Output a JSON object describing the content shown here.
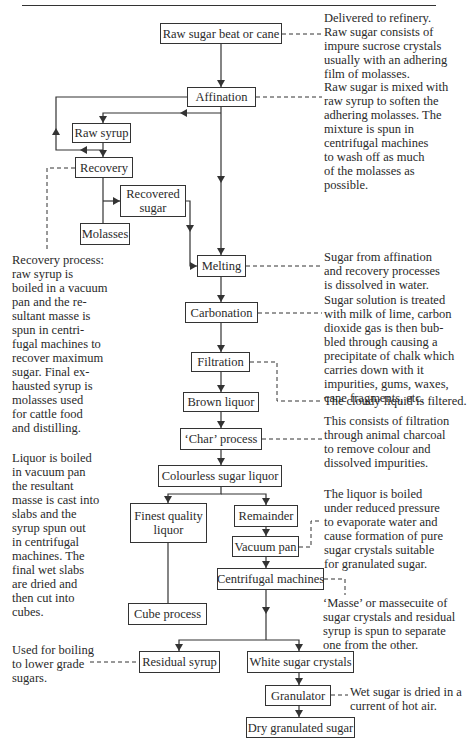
{
  "nodes": [
    {
      "id": "raw_sugar",
      "label": "Raw sugar beat or cane",
      "x": 160,
      "y": 23,
      "w": 122,
      "h": 21
    },
    {
      "id": "affination",
      "label": "Affination",
      "x": 187,
      "y": 87,
      "w": 69,
      "h": 20
    },
    {
      "id": "raw_syrup",
      "label": "Raw syrup",
      "x": 72,
      "y": 123,
      "w": 59,
      "h": 20
    },
    {
      "id": "recovery",
      "label": "Recovery",
      "x": 75,
      "y": 157,
      "w": 58,
      "h": 21
    },
    {
      "id": "recovered_sugar",
      "label": "Recovered\nsugar",
      "x": 120,
      "y": 185,
      "w": 66,
      "h": 32
    },
    {
      "id": "molasses",
      "label": "Molasses",
      "x": 80,
      "y": 223,
      "w": 50,
      "h": 22
    },
    {
      "id": "melting",
      "label": "Melting",
      "x": 197,
      "y": 255,
      "w": 49,
      "h": 22
    },
    {
      "id": "carbonation",
      "label": "Carbonation",
      "x": 185,
      "y": 302,
      "w": 73,
      "h": 21
    },
    {
      "id": "filtration",
      "label": "Filtration",
      "x": 191,
      "y": 352,
      "w": 59,
      "h": 20
    },
    {
      "id": "brown_liquor",
      "label": "Brown liquor",
      "x": 183,
      "y": 392,
      "w": 76,
      "h": 20
    },
    {
      "id": "char_process",
      "label": "‘Char’ process",
      "x": 180,
      "y": 428,
      "w": 82,
      "h": 22
    },
    {
      "id": "colourless_liquor",
      "label": "Colourless sugar liquor",
      "x": 158,
      "y": 465,
      "w": 124,
      "h": 22
    },
    {
      "id": "finest_liquor",
      "label": "Finest quality\nliquor",
      "x": 130,
      "y": 503,
      "w": 77,
      "h": 40
    },
    {
      "id": "remainder",
      "label": "Remainder",
      "x": 234,
      "y": 505,
      "w": 64,
      "h": 22
    },
    {
      "id": "vacuum_pan",
      "label": "Vacuum pan",
      "x": 232,
      "y": 536,
      "w": 67,
      "h": 21
    },
    {
      "id": "centrifugal",
      "label": "Centrifugal machines",
      "x": 217,
      "y": 568,
      "w": 107,
      "h": 22
    },
    {
      "id": "cube_process",
      "label": "Cube process",
      "x": 128,
      "y": 603,
      "w": 79,
      "h": 22
    },
    {
      "id": "residual_syrup",
      "label": "Residual syrup",
      "x": 139,
      "y": 651,
      "w": 81,
      "h": 22
    },
    {
      "id": "white_crystals",
      "label": "White sugar crystals",
      "x": 247,
      "y": 651,
      "w": 107,
      "h": 22
    },
    {
      "id": "granulator",
      "label": "Granulator",
      "x": 265,
      "y": 685,
      "w": 66,
      "h": 21
    },
    {
      "id": "dry_sugar",
      "label": "Dry granulated sugar",
      "x": 246,
      "y": 717,
      "w": 109,
      "h": 21
    }
  ],
  "notes": [
    {
      "id": "note_raw_sugar",
      "x": 324,
      "y": 11,
      "text": "Delivered to refinery.\nRaw sugar consists of\nimpure sucrose crystals\nusually with an adhering\nfilm of molasses."
    },
    {
      "id": "note_affination",
      "x": 324,
      "y": 80,
      "text": "Raw sugar is mixed with\nraw syrup to soften the\nadhering molasses. The\nmixture is spun in\ncentrifugal machines\nto wash off as much\nof the molasses as\npossible."
    },
    {
      "id": "note_recovery",
      "x": 12,
      "y": 253,
      "text": "Recovery process:\nraw syrup is\nboiled in a vacuum\npan and the re-\nsultant masse is\nspun in centri-\nfugal machines to\nrecover maximum\nsugar. Final ex-\nhausted syrup is\nmolasses used\nfor cattle food\nand distilling."
    },
    {
      "id": "note_melting",
      "x": 324,
      "y": 250,
      "text": "Sugar from affination\nand recovery processes\nis dissolved in water."
    },
    {
      "id": "note_carbonation",
      "x": 324,
      "y": 293,
      "text": "Sugar solution is treated\nwith milk of lime, carbon\ndioxide gas is then bub-\nbled through causing a\nprecipitate of chalk which\ncarries down with it\nimpurities, gums, waxes,\ncane fragments, etc."
    },
    {
      "id": "note_filtration",
      "x": 324,
      "y": 394,
      "text": "The cloudy liquid is filtered."
    },
    {
      "id": "note_char",
      "x": 324,
      "y": 414,
      "text": "This consists of filtration\nthrough animal charcoal\nto remove colour and\ndissolved impurities."
    },
    {
      "id": "note_cube",
      "x": 12,
      "y": 451,
      "text": "Liquor is boiled\nin vacuum pan\nthe resultant\nmasse is cast into\nslabs and the\nsyrup spun out\nin centrifugal\nmachines. The\nfinal wet slabs\nare dried and\nthen cut into\ncubes."
    },
    {
      "id": "note_vacuum_pan",
      "x": 324,
      "y": 487,
      "text": "The liquor is boiled\nunder reduced pressure\nto evaporate water and\ncause formation of pure\nsugar crystals suitable\nfor granulated sugar."
    },
    {
      "id": "note_centrifugal",
      "x": 323,
      "y": 596,
      "text": "‘Masse’ or massecuite of\nsugar crystals and residual\nsyrup is spun to separate\none from the other."
    },
    {
      "id": "note_residual",
      "x": 12,
      "y": 643,
      "text": "Used for boiling\nto lower grade\nsugars."
    },
    {
      "id": "note_granulator",
      "x": 350,
      "y": 685,
      "text": "Wet sugar is dried in a\ncurrent of hot air."
    }
  ],
  "arrows": [
    {
      "points": [
        [
          221,
          44
        ],
        [
          221,
          87
        ]
      ],
      "head": "down"
    },
    {
      "points": [
        [
          221,
          107
        ],
        [
          221,
          255
        ]
      ],
      "head": "down"
    },
    {
      "points": [
        [
          221,
          113
        ],
        [
          103,
          113
        ],
        [
          103,
          123
        ]
      ],
      "head": "down"
    },
    {
      "points": [
        [
          187,
          97
        ],
        [
          56,
          97
        ],
        [
          56,
          150
        ],
        [
          103,
          150
        ]
      ],
      "head": "none"
    },
    {
      "points": [
        [
          103,
          143
        ],
        [
          103,
          157
        ]
      ],
      "head": "down"
    },
    {
      "points": [
        [
          103,
          178
        ],
        [
          103,
          223
        ]
      ],
      "head": "none"
    },
    {
      "points": [
        [
          103,
          201
        ],
        [
          120,
          201
        ]
      ],
      "head": "right"
    },
    {
      "points": [
        [
          186,
          201
        ],
        [
          190,
          201
        ],
        [
          190,
          266
        ],
        [
          197,
          266
        ]
      ],
      "head": "right"
    },
    {
      "points": [
        [
          221,
          277
        ],
        [
          221,
          302
        ]
      ],
      "head": "down"
    },
    {
      "points": [
        [
          221,
          323
        ],
        [
          221,
          352
        ]
      ],
      "head": "down"
    },
    {
      "points": [
        [
          221,
          372
        ],
        [
          221,
          392
        ]
      ],
      "head": "down"
    },
    {
      "points": [
        [
          221,
          412
        ],
        [
          221,
          428
        ]
      ],
      "head": "down"
    },
    {
      "points": [
        [
          221,
          450
        ],
        [
          221,
          465
        ]
      ],
      "head": "down"
    },
    {
      "points": [
        [
          221,
          487
        ],
        [
          221,
          494
        ],
        [
          168,
          494
        ],
        [
          168,
          503
        ]
      ],
      "head": "down"
    },
    {
      "points": [
        [
          221,
          494
        ],
        [
          266,
          494
        ],
        [
          266,
          505
        ]
      ],
      "head": "down"
    },
    {
      "points": [
        [
          168,
          543
        ],
        [
          168,
          603
        ]
      ],
      "head": "none"
    },
    {
      "points": [
        [
          266,
          527
        ],
        [
          266,
          536
        ]
      ],
      "head": "down"
    },
    {
      "points": [
        [
          266,
          557
        ],
        [
          266,
          568
        ]
      ],
      "head": "down"
    },
    {
      "points": [
        [
          266,
          590
        ],
        [
          266,
          640
        ]
      ],
      "head": "none"
    },
    {
      "points": [
        [
          266,
          640
        ],
        [
          179,
          640
        ],
        [
          179,
          651
        ]
      ],
      "head": "down"
    },
    {
      "points": [
        [
          266,
          640
        ],
        [
          299,
          640
        ],
        [
          299,
          651
        ]
      ],
      "head": "down"
    },
    {
      "points": [
        [
          299,
          673
        ],
        [
          299,
          685
        ]
      ],
      "head": "down"
    },
    {
      "points": [
        [
          299,
          706
        ],
        [
          299,
          717
        ]
      ],
      "head": "down"
    }
  ],
  "flow_markers": [
    {
      "x": 56,
      "y": 128,
      "dir": "up"
    },
    {
      "x": 80,
      "y": 150,
      "dir": "left"
    },
    {
      "x": 180,
      "y": 113,
      "dir": "left"
    },
    {
      "x": 221,
      "y": 183,
      "dir": "down"
    },
    {
      "x": 190,
      "y": 232,
      "dir": "down"
    },
    {
      "x": 266,
      "y": 614,
      "dir": "down"
    }
  ],
  "dashed": [
    {
      "points": [
        [
          282,
          34
        ],
        [
          324,
          34
        ]
      ]
    },
    {
      "points": [
        [
          256,
          97
        ],
        [
          322,
          97
        ]
      ]
    },
    {
      "points": [
        [
          75,
          168
        ],
        [
          47,
          168
        ],
        [
          47,
          250
        ]
      ]
    },
    {
      "points": [
        [
          246,
          266
        ],
        [
          322,
          266
        ]
      ]
    },
    {
      "points": [
        [
          258,
          313
        ],
        [
          322,
          313
        ]
      ]
    },
    {
      "points": [
        [
          250,
          362
        ],
        [
          277,
          362
        ],
        [
          277,
          401
        ],
        [
          322,
          401
        ]
      ]
    },
    {
      "points": [
        [
          262,
          439
        ],
        [
          322,
          439
        ]
      ]
    },
    {
      "points": [
        [
          299,
          547
        ],
        [
          311,
          547
        ],
        [
          311,
          521
        ],
        [
          320,
          521
        ]
      ]
    },
    {
      "points": [
        [
          324,
          579
        ],
        [
          345,
          579
        ],
        [
          345,
          595
        ]
      ]
    },
    {
      "points": [
        [
          90,
          662
        ],
        [
          139,
          662
        ]
      ]
    },
    {
      "points": [
        [
          331,
          695
        ],
        [
          348,
          695
        ]
      ]
    }
  ]
}
